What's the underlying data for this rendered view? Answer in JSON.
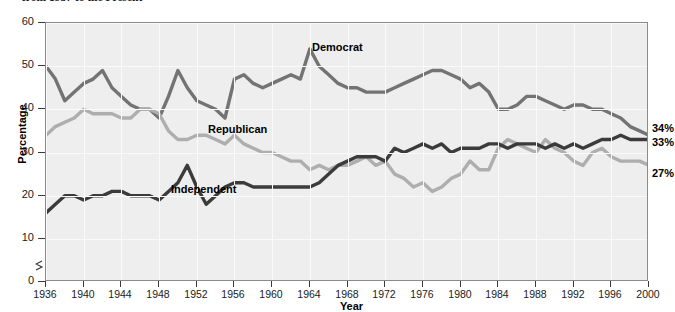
{
  "title": "from 1937 to the Present",
  "axis": {
    "ylabel": "Percentage",
    "xlabel": "Year",
    "yticks": [
      "0",
      "10",
      "20",
      "30",
      "40",
      "50",
      "60"
    ],
    "xticks": [
      "1936",
      "1940",
      "1944",
      "1948",
      "1952",
      "1956",
      "1960",
      "1964",
      "1968",
      "1972",
      "1976",
      "1980",
      "1984",
      "1988",
      "1992",
      "1996",
      "2000"
    ]
  },
  "series_labels": {
    "democrat": "Democrat",
    "republican": "Republican",
    "independent": "Independent"
  },
  "end_labels": {
    "democrat": "34%",
    "independent": "33%",
    "republican": "27%"
  },
  "colors": {
    "democrat": "#737373",
    "republican": "#aeaeae",
    "independent": "#3b3b3b",
    "plot_background": "#eeeeee",
    "gridline": "#fafafa",
    "frame": "#8b8b8b"
  },
  "chart_data": {
    "type": "line",
    "title": "from 1937 to the Present",
    "xlabel": "Year",
    "ylabel": "Percentage",
    "xlim": [
      1936,
      2000
    ],
    "ylim": [
      0,
      60
    ],
    "yticks": [
      0,
      10,
      20,
      30,
      40,
      50,
      60
    ],
    "xticks": [
      1936,
      1940,
      1944,
      1948,
      1952,
      1956,
      1960,
      1964,
      1968,
      1972,
      1976,
      1980,
      1984,
      1988,
      1992,
      1996,
      2000
    ],
    "grid": true,
    "legend": "inline-labels",
    "y_axis_break": true,
    "x": [
      1936,
      1937,
      1938,
      1939,
      1940,
      1941,
      1942,
      1943,
      1944,
      1945,
      1946,
      1947,
      1948,
      1949,
      1950,
      1951,
      1952,
      1953,
      1954,
      1955,
      1956,
      1957,
      1958,
      1959,
      1960,
      1961,
      1962,
      1963,
      1964,
      1965,
      1966,
      1967,
      1968,
      1969,
      1970,
      1971,
      1972,
      1973,
      1974,
      1975,
      1976,
      1977,
      1978,
      1979,
      1980,
      1981,
      1982,
      1983,
      1984,
      1985,
      1986,
      1987,
      1988,
      1989,
      1990,
      1991,
      1992,
      1993,
      1994,
      1995,
      1996,
      1997,
      1998,
      1999,
      2000
    ],
    "series": [
      {
        "name": "Democrat",
        "color": "#737373",
        "values": [
          50,
          47,
          42,
          44,
          46,
          47,
          49,
          45,
          43,
          41,
          40,
          40,
          38,
          43,
          49,
          45,
          42,
          41,
          40,
          38,
          47,
          48,
          46,
          45,
          46,
          47,
          48,
          47,
          54,
          50,
          48,
          46,
          45,
          45,
          44,
          44,
          44,
          45,
          46,
          47,
          48,
          49,
          49,
          48,
          47,
          45,
          46,
          44,
          40,
          40,
          41,
          43,
          43,
          42,
          41,
          40,
          41,
          41,
          40,
          40,
          39,
          38,
          36,
          35,
          34
        ]
      },
      {
        "name": "Republican",
        "color": "#aeaeae",
        "values": [
          34,
          36,
          37,
          38,
          40,
          39,
          39,
          39,
          38,
          38,
          40,
          40,
          39,
          35,
          33,
          33,
          34,
          34,
          33,
          32,
          34,
          32,
          31,
          30,
          30,
          29,
          28,
          28,
          26,
          27,
          26,
          27,
          27,
          28,
          29,
          27,
          28,
          25,
          24,
          22,
          23,
          21,
          22,
          24,
          25,
          28,
          26,
          26,
          31,
          33,
          32,
          31,
          30,
          33,
          31,
          30,
          28,
          27,
          30,
          31,
          29,
          28,
          28,
          28,
          27
        ]
      },
      {
        "name": "Independent",
        "color": "#3b3b3b",
        "values": [
          16,
          18,
          20,
          20,
          19,
          20,
          20,
          21,
          21,
          20,
          20,
          20,
          19,
          21,
          23,
          27,
          22,
          18,
          20,
          22,
          23,
          23,
          22,
          22,
          22,
          22,
          22,
          22,
          22,
          23,
          25,
          27,
          28,
          29,
          29,
          29,
          28,
          31,
          30,
          31,
          32,
          31,
          32,
          30,
          31,
          31,
          31,
          32,
          32,
          31,
          32,
          32,
          32,
          31,
          32,
          31,
          32,
          31,
          32,
          33,
          33,
          34,
          33,
          33,
          33
        ]
      }
    ],
    "annotations": [
      {
        "text": "34%",
        "series": "Democrat",
        "x": 2000,
        "y": 34
      },
      {
        "text": "33%",
        "series": "Independent",
        "x": 2000,
        "y": 33
      },
      {
        "text": "27%",
        "series": "Republican",
        "x": 2000,
        "y": 27
      }
    ]
  }
}
